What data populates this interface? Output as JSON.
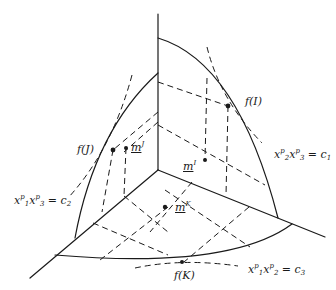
{
  "figure": {
    "type": "3d-surface-diagram",
    "points": {
      "f_I": {
        "label": "f(I)"
      },
      "f_J": {
        "label": "f(J)"
      },
      "f_K": {
        "label": "f(K)"
      },
      "m_I": {
        "base": "m",
        "sup": "I"
      },
      "m_J": {
        "base": "m",
        "sup": "J"
      },
      "m_K": {
        "base": "m",
        "sup": "K"
      }
    },
    "curves": [
      {
        "id": "c1",
        "lhs_a": "x",
        "sup_a": "p",
        "sub_a": "2",
        "lhs_b": "x",
        "sup_b": "p",
        "sub_b": "3",
        "rhs": "c",
        "rhs_sub": "1"
      },
      {
        "id": "c2",
        "lhs_a": "x",
        "sup_a": "p",
        "sub_a": "1",
        "lhs_b": "x",
        "sup_b": "p",
        "sub_b": "3",
        "rhs": "c",
        "rhs_sub": "2"
      },
      {
        "id": "c3",
        "lhs_a": "x",
        "sup_a": "p",
        "sub_a": "1",
        "lhs_b": "x",
        "sup_b": "p",
        "sub_b": "2",
        "rhs": "c",
        "rhs_sub": "3"
      }
    ],
    "equals": "=",
    "colors": {
      "ink": "#1a1a1a",
      "background": "#ffffff"
    }
  }
}
